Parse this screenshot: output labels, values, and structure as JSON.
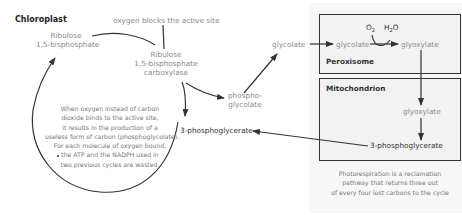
{
  "title": "Chloroplast",
  "annotations": {
    "oxygen_blocks": "oxygen blocks the active site"
  },
  "nodes": {
    "rubp_line1": "Ribulose",
    "rubp_line2": "1,5-bisphosphate",
    "rubisco_line1": "Ribulose",
    "rubisco_line2": "1,5-bisphosphate",
    "rubisco_line3": "carboxylase",
    "phosphoglycolate_line1": "phospho-",
    "phosphoglycolate_line2": "glycolate",
    "glycolate_chloroplast": "glycolate",
    "glycolate_peroxisome": "glycolate",
    "glyoxylate_peroxisome": "glyoxylate",
    "glyoxylate_mito": "glyoxylate",
    "pga_mito": "3-phosphoglycerate",
    "pga_chloroplast": "3-phosphoglycerate",
    "o2": "O",
    "o2_sub": "2",
    "h2o_h": "H",
    "h2o_sub": "2",
    "h2o_o": "O"
  },
  "compartments": {
    "peroxisome": "Peroxisome",
    "mitochondrion": "Mitochondrion"
  },
  "notes": {
    "circle_note": [
      "When oxygen instead  of carbon",
      "dioxide binds to the active site,",
      "it results in the production of a",
      "useless form of carbon (phosphoglycolate).",
      "For each molecule of oxygen bound,",
      "the ATP and the NADPH used in",
      "two previous cycles are wasted."
    ],
    "caption": [
      "Photorespiration is a reclamation",
      "pathway that returns three out",
      "of every four lost carbons to the cycle"
    ]
  },
  "colors": {
    "arrow": "#333333",
    "text": "#8a8a8a",
    "panel": "#f7f7f7",
    "box_border": "#333333"
  }
}
